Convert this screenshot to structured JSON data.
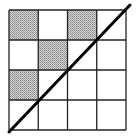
{
  "diagram": {
    "type": "grid-with-diagonal",
    "rows": 4,
    "cols": 4,
    "grid": {
      "x": 9,
      "y": 10,
      "width": 117,
      "height": 120,
      "stroke": "#222222"
    },
    "shaded_cells": [
      [
        0,
        0
      ],
      [
        0,
        2
      ],
      [
        1,
        1
      ],
      [
        2,
        0
      ]
    ],
    "shade_color": "#b8b8b8",
    "diagonal": {
      "x1": 9,
      "y1": 132,
      "x2": 130,
      "y2": 5,
      "stroke": "#000000",
      "width": 3
    }
  }
}
